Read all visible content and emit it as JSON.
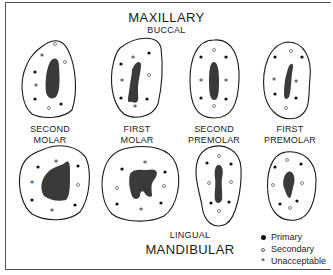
{
  "header": {
    "title": "MAXILLARY",
    "subtitle": "BUCCAL"
  },
  "footer": {
    "subtitle": "LINGUAL",
    "title": "MANDIBULAR"
  },
  "teeth_labels": [
    {
      "line1": "SECOND",
      "line2": "MOLAR"
    },
    {
      "line1": "FIRST",
      "line2": "MOLAR"
    },
    {
      "line1": "SECOND",
      "line2": "PREMOLAR"
    },
    {
      "line1": "FIRST",
      "line2": "PREMOLAR"
    }
  ],
  "legend": {
    "items": [
      {
        "symbol": "filled-dot",
        "label": "Primary"
      },
      {
        "symbol": "open-dot",
        "label": "Secondary"
      },
      {
        "symbol": "asterisk",
        "label": "Unacceptable"
      }
    ]
  },
  "colors": {
    "outline": "#1a1a1a",
    "pulp": "#3a3a3a",
    "primary": "#111111",
    "secondary": "#666666"
  },
  "symbols": {
    "unacceptable": "*"
  }
}
